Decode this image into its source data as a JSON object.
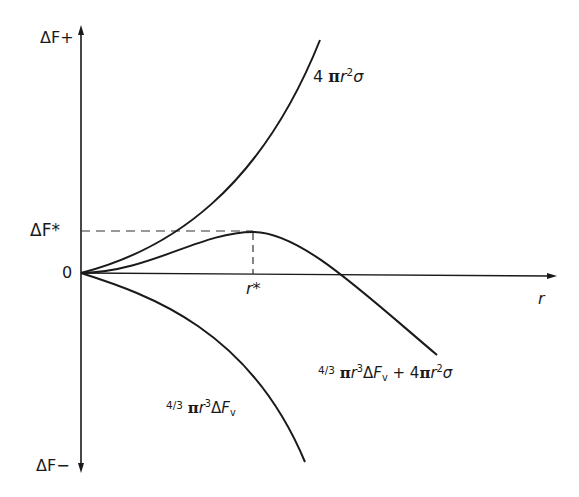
{
  "diagram": {
    "axes": {
      "y_top_label": "ΔF+",
      "y_bottom_label": "ΔF−",
      "x_label": "r",
      "origin_label": "0",
      "critical_energy_label": "ΔF*",
      "critical_radius_label": "r*"
    },
    "curves": [
      {
        "name": "surface-term",
        "label_parts": {
          "coef": "4",
          "pi": "π",
          "r": "r",
          "exp": "2",
          "sigma": "σ"
        }
      },
      {
        "name": "total",
        "label_parts": {
          "frac": "4/3",
          "pi": "π",
          "r": "r",
          "exp3": "3",
          "delta": "Δ",
          "F": "F",
          "v": "v",
          "plus": " + ",
          "coef": "4",
          "pi2": "π",
          "r2": "r",
          "exp2": "2",
          "sigma": "σ"
        }
      },
      {
        "name": "volume-term",
        "label_parts": {
          "frac": "4/3",
          "pi": "π",
          "r": "r",
          "exp": "3",
          "delta": "Δ",
          "F": "F",
          "v": "v"
        }
      }
    ],
    "colors": {
      "line": "#1a1a1a",
      "dashed": "#333333",
      "background": "#ffffff"
    }
  }
}
